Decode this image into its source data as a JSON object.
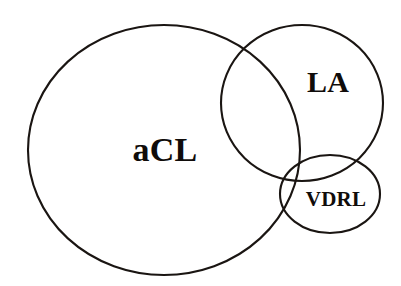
{
  "diagram": {
    "type": "venn-diagram",
    "set_count": 3,
    "background_color": "#ffffff",
    "stroke_color": "#1a1512",
    "text_color": "#100c0a",
    "sets": [
      {
        "id": "acl",
        "label": "aCL",
        "shape": "ellipse",
        "center_x": 164,
        "center_y": 150,
        "radius_x": 136,
        "radius_y": 125,
        "label_x": 165,
        "label_y": 150
      },
      {
        "id": "la",
        "label": "LA",
        "shape": "ellipse",
        "center_x": 302,
        "center_y": 103,
        "radius_x": 81,
        "radius_y": 78,
        "label_x": 328,
        "label_y": 82
      },
      {
        "id": "vdrl",
        "label": "VDRL",
        "shape": "ellipse",
        "center_x": 330,
        "center_y": 194,
        "radius_x": 50,
        "radius_y": 39,
        "label_x": 336,
        "label_y": 199
      }
    ]
  }
}
